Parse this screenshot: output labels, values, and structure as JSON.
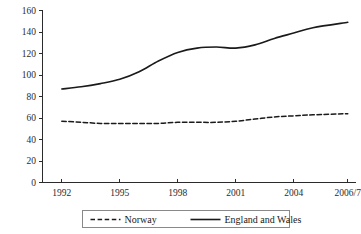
{
  "chart_data": {
    "type": "line",
    "title": "",
    "subtitle": "",
    "xlabel": "",
    "ylabel": "",
    "grid": false,
    "legend_position": "bottom",
    "x": [
      1992,
      1993,
      1994,
      1995,
      1996,
      1997,
      1998,
      1999,
      2000,
      2001,
      2002,
      2003,
      2004,
      2005,
      "2006/7"
    ],
    "x_tick_labels": [
      "1992",
      "1995",
      "1998",
      "2001",
      "2004",
      "2006/7"
    ],
    "x_tick_values": [
      1992,
      1995,
      1998,
      2001,
      2004,
      2006.8
    ],
    "xlim": [
      1991.0,
      2007.2
    ],
    "y_tick_labels": [
      "0",
      "20",
      "40",
      "60",
      "80",
      "100",
      "120",
      "140",
      "160"
    ],
    "y_tick_values": [
      0,
      20,
      40,
      60,
      80,
      100,
      120,
      140,
      160
    ],
    "ylim": [
      0,
      160
    ],
    "series": [
      {
        "name": "Norway",
        "style": "dashed",
        "color": "#1a1a1a",
        "values": [
          57,
          56,
          55,
          55,
          55,
          55,
          56,
          56,
          56,
          57,
          59,
          61,
          62,
          63,
          64
        ]
      },
      {
        "name": "England and Wales",
        "style": "solid",
        "color": "#1a1a1a",
        "values": [
          87,
          89,
          92,
          96,
          103,
          113,
          121,
          125,
          126,
          125,
          128,
          134,
          139,
          144,
          149
        ]
      }
    ]
  },
  "legend": {
    "entries": [
      {
        "label": "Norway",
        "style": "dashed"
      },
      {
        "label": "England and Wales",
        "style": "solid"
      }
    ]
  }
}
